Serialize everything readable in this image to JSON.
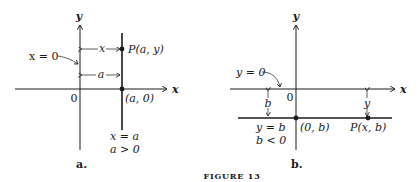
{
  "figure": {
    "caption": "FIGURE 13",
    "panels": [
      {
        "id": "a",
        "label": "a.",
        "y_axis_label": "y",
        "x_axis_label": "x",
        "origin_label": "0",
        "axis_line_label": "x = 0",
        "vertical_line_label": "x = a",
        "condition_label": "a > 0",
        "point_label": "P(a, y)",
        "intercept_label": "(a, 0)",
        "distance_top_label": "x",
        "distance_bottom_label": "a"
      },
      {
        "id": "b",
        "label": "b.",
        "y_axis_label": "y",
        "x_axis_label": "x",
        "origin_label": "0",
        "axis_line_label": "y = 0",
        "horizontal_line_label": "y = b",
        "condition_label": "b < 0",
        "point_label": "P(x, b)",
        "intercept_label": "(0, b)",
        "distance_left_label": "b",
        "distance_right_label": "y"
      }
    ]
  }
}
